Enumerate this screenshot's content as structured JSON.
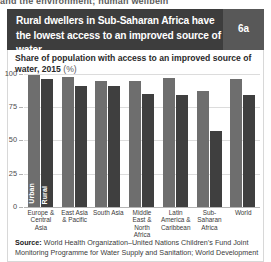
{
  "clipped_header": "and the environment; human wellbein",
  "title": "Rural dwellers in Sub-Saharan Africa have the lowest access to an improved source of water",
  "badge": "6a",
  "subtitle_main": "Share of population with access to an improved source of water, 2015",
  "subtitle_unit": "(%)",
  "source_label": "Source:",
  "source_text": "World Health Organization–United Nations Children’s Fund Joint Monitoring Programme for Water Supply and Sanitation; World Development",
  "colors": {
    "title_bar": "#3d3d3d",
    "badge_bg": "#585858",
    "urban_bar": "#6e6e6e",
    "rural_bar": "#3f3f3f",
    "grid": "#dcdcdc"
  },
  "chart_data": {
    "type": "bar",
    "title": "Rural dwellers in Sub-Saharan Africa have the lowest access to an improved source of water",
    "subtitle": "Share of population with access to an improved source of water, 2015 (%)",
    "xlabel": "",
    "ylabel": "%",
    "ylim": [
      0,
      100
    ],
    "yticks": [
      0,
      25,
      50,
      75,
      100
    ],
    "ytick_labels": [
      "0",
      "25",
      "50",
      "75",
      "100"
    ],
    "grid": true,
    "legend_position": "in-bar",
    "categories": [
      "Europe & Central Asia",
      "East Asia & Pacific",
      "South Asia",
      "Middle East & North Africa",
      "Latin America & Caribbean",
      "Sub-Saharan Africa",
      "World"
    ],
    "series": [
      {
        "name": "Urban",
        "values": [
          99,
          98,
          95,
          95,
          97,
          87,
          96
        ]
      },
      {
        "name": "Rural",
        "values": [
          96,
          91,
          91,
          85,
          84,
          57,
          84
        ]
      }
    ]
  }
}
